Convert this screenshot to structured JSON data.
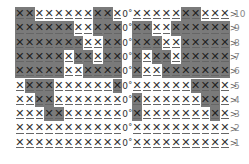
{
  "chart": {
    "title": "",
    "legend": {
      "shaded_color": "#7a7a7a",
      "cell_symbol": "X",
      "chain_symbol": "0˚",
      "row_end_symbol": ">",
      "row_start_symbol": "<"
    },
    "left_columns": 11,
    "right_columns": 10,
    "rows": [
      {
        "number": "10",
        "left": [
          1,
          1,
          0,
          0,
          0,
          0,
          0,
          0,
          1,
          1,
          0
        ],
        "right": [
          0,
          0,
          0,
          0,
          0,
          1,
          1,
          0,
          0,
          0
        ]
      },
      {
        "number": "9",
        "left": [
          1,
          1,
          1,
          1,
          1,
          1,
          0,
          0,
          1,
          1,
          1
        ],
        "right": [
          1,
          1,
          0,
          0,
          1,
          1,
          1,
          1,
          1,
          1
        ]
      },
      {
        "number": "8",
        "left": [
          1,
          1,
          1,
          1,
          1,
          1,
          1,
          0,
          0,
          1,
          1
        ],
        "right": [
          1,
          1,
          1,
          0,
          0,
          1,
          1,
          1,
          1,
          1
        ]
      },
      {
        "number": "7",
        "left": [
          1,
          1,
          1,
          1,
          1,
          0,
          1,
          1,
          0,
          1,
          1
        ],
        "right": [
          1,
          0,
          1,
          1,
          0,
          1,
          1,
          1,
          1,
          1
        ]
      },
      {
        "number": "6",
        "left": [
          1,
          1,
          1,
          1,
          1,
          0,
          0,
          1,
          1,
          1,
          1
        ],
        "right": [
          1,
          0,
          0,
          1,
          1,
          1,
          1,
          1,
          1,
          1
        ]
      },
      {
        "number": "5",
        "left": [
          0,
          1,
          1,
          1,
          0,
          0,
          0,
          0,
          0,
          0,
          1
        ],
        "right": [
          0,
          0,
          0,
          0,
          0,
          0,
          1,
          1,
          1,
          0
        ]
      },
      {
        "number": "4",
        "left": [
          0,
          0,
          1,
          1,
          0,
          0,
          0,
          0,
          0,
          0,
          0
        ],
        "right": [
          1,
          0,
          0,
          0,
          0,
          0,
          0,
          1,
          1,
          0
        ]
      },
      {
        "number": "3",
        "left": [
          0,
          0,
          0,
          1,
          1,
          0,
          0,
          0,
          0,
          0,
          0
        ],
        "right": [
          1,
          0,
          0,
          0,
          0,
          0,
          0,
          0,
          1,
          0
        ]
      },
      {
        "number": "2",
        "left": [
          0,
          0,
          0,
          0,
          0,
          0,
          0,
          0,
          0,
          0,
          0
        ],
        "right": [
          0,
          0,
          0,
          0,
          0,
          0,
          0,
          0,
          0,
          0
        ]
      },
      {
        "number": "1",
        "left": [
          0,
          0,
          0,
          0,
          0,
          0,
          0,
          0,
          0,
          0,
          0
        ],
        "right": [
          0,
          0,
          0,
          0,
          0,
          0,
          0,
          0,
          0,
          0
        ]
      }
    ]
  }
}
